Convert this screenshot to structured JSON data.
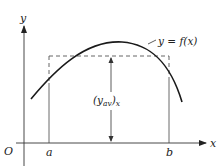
{
  "diagram": {
    "title": "",
    "axes": {
      "x_label": "x",
      "y_label": "y",
      "origin_label": "O"
    },
    "ticks": {
      "a_label": "a",
      "b_label": "b"
    },
    "curve": {
      "label": "y = f(x)"
    },
    "average": {
      "label_main": "(y",
      "label_sub": "av",
      "label_close": ")",
      "label_outer_sub": "x"
    },
    "colors": {
      "ink": "#222222",
      "dashed": "#555555",
      "background": "#ffffff"
    }
  }
}
